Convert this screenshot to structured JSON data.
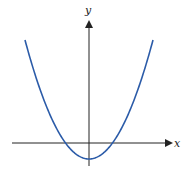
{
  "chart_data": {
    "type": "line",
    "title": "",
    "xlabel": "x",
    "ylabel": "y",
    "series": [
      {
        "name": "parabola",
        "color": "#2b5ba8",
        "x": [
          -64,
          -48,
          -32,
          -24,
          -16,
          0,
          16,
          24,
          32,
          48,
          64
        ],
        "y": [
          103,
          51,
          11,
          -1,
          -10,
          -16,
          -10,
          -1,
          11,
          51,
          103
        ]
      }
    ],
    "grid": false,
    "legend": null
  },
  "labels": {
    "x_axis": "x",
    "y_axis": "y"
  },
  "colors": {
    "curve": "#2b5ba8",
    "axes": "#222222"
  }
}
